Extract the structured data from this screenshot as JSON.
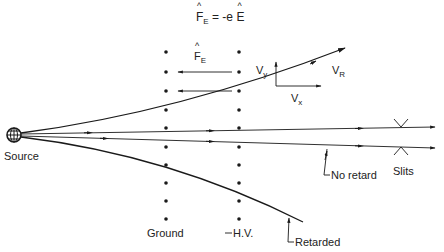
{
  "equation": {
    "lhs_symbol": "F",
    "lhs_sub": "E",
    "rhs": "= -e",
    "rhs_symbol": "E"
  },
  "force_label": {
    "symbol": "F",
    "sub": "E"
  },
  "velocity_labels": {
    "vy": {
      "symbol": "V",
      "sub": "y"
    },
    "vx": {
      "symbol": "V",
      "sub": "x"
    },
    "vr": {
      "symbol": "V",
      "sub": "R"
    }
  },
  "labels": {
    "source": "Source",
    "ground": "Ground",
    "hv": "H.V.",
    "slits": "Slits",
    "no_retard": "No retard",
    "retarded": "Retarded"
  },
  "colors": {
    "ink": "#1a1a1a",
    "background": "#ffffff"
  },
  "electrode_dots_y": [
    52,
    72,
    91,
    110,
    128,
    147,
    165,
    183,
    201,
    219
  ],
  "columns": {
    "ground_x": 166,
    "hv_x": 239
  }
}
